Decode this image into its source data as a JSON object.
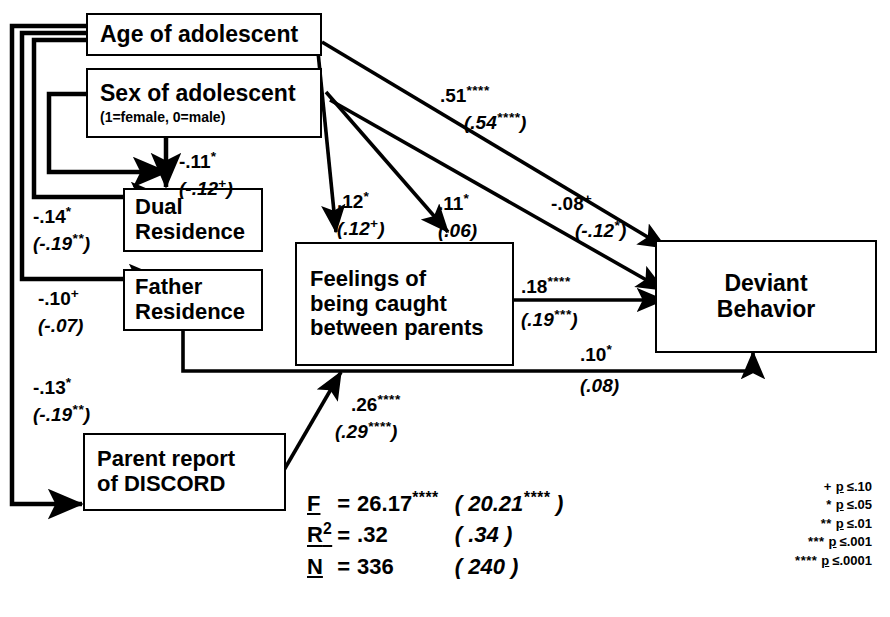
{
  "diagram": {
    "type": "path-diagram",
    "nodes": [
      {
        "id": "age",
        "label": "Age of adolescent",
        "sublabel": ""
      },
      {
        "id": "sex",
        "label": "Sex of adolescent",
        "sublabel": "(1=female, 0=male)"
      },
      {
        "id": "dual",
        "label": "Dual\nResidence",
        "sublabel": ""
      },
      {
        "id": "father",
        "label": "Father\nResidence",
        "sublabel": ""
      },
      {
        "id": "caught",
        "label": "Feelings of\nbeing caught\nbetween parents",
        "sublabel": ""
      },
      {
        "id": "deviant",
        "label": "Deviant\nBehavior",
        "sublabel": ""
      },
      {
        "id": "discord",
        "label": "Parent report\nof DISCORD",
        "sublabel": ""
      }
    ],
    "paths": [
      {
        "id": "sex-dual",
        "from": "sex",
        "to": "dual",
        "coef": "-.11",
        "stars": "*",
        "coef2": "(-.12",
        "stars2": "+",
        "coef2_close": ")"
      },
      {
        "id": "age-dual",
        "from": "age",
        "to": "dual",
        "coef": "-.14",
        "stars": "*",
        "coef2": "(-.19",
        "stars2": "**",
        "coef2_close": ")"
      },
      {
        "id": "age-father",
        "from": "age",
        "to": "father",
        "coef": "-.10",
        "stars": "+",
        "coef2": "(-.07",
        "stars2": "",
        "coef2_close": ")"
      },
      {
        "id": "age-discord",
        "from": "age",
        "to": "discord",
        "coef": "-.13",
        "stars": "*",
        "coef2": "(-.19",
        "stars2": "**",
        "coef2_close": ")"
      },
      {
        "id": "age-caught",
        "from": "age",
        "to": "caught",
        "coef": ".12",
        "stars": "*",
        "coef2": "(.12",
        "stars2": "+",
        "coef2_close": ")"
      },
      {
        "id": "sex-caught",
        "from": "sex",
        "to": "caught",
        "coef": ".11",
        "stars": "*",
        "coef2": "(.06",
        "stars2": "",
        "coef2_close": ")"
      },
      {
        "id": "sex-deviant",
        "from": "sex",
        "to": "deviant",
        "coef": "-.08",
        "stars": "+",
        "coef2": "(-.12",
        "stars2": "*",
        "coef2_close": ")"
      },
      {
        "id": "age-deviant",
        "from": "age",
        "to": "deviant",
        "coef": ".51",
        "stars": "****",
        "coef2": "(.54",
        "stars2": "****",
        "coef2_close": ")"
      },
      {
        "id": "caught-deviant",
        "from": "caught",
        "to": "deviant",
        "coef": ".18",
        "stars": "****",
        "coef2": "(.19",
        "stars2": "***",
        "coef2_close": ")"
      },
      {
        "id": "father-deviant",
        "from": "father",
        "to": "deviant",
        "coef": ".10",
        "stars": "*",
        "coef2": "(.08",
        "stars2": "",
        "coef2_close": ")"
      },
      {
        "id": "discord-caught",
        "from": "discord",
        "to": "caught",
        "coef": ".26",
        "stars": "****",
        "coef2": "(.29",
        "stars2": "****",
        "coef2_close": ")"
      }
    ]
  },
  "stats": {
    "rows": [
      {
        "key": "F",
        "sup": "",
        "eq": "=",
        "value": "26.17",
        "stars": "****",
        "paren": "( 20.21",
        "paren_stars": "****",
        "paren_close": " )"
      },
      {
        "key": "R",
        "sup": "2",
        "eq": "=",
        "value": ".32",
        "stars": "",
        "paren": "( .34",
        "paren_stars": "",
        "paren_close": " )"
      },
      {
        "key": "N",
        "sup": "",
        "eq": "=",
        "value": "336",
        "stars": "",
        "paren": "( 240",
        "paren_stars": "",
        "paren_close": " )"
      }
    ]
  },
  "legend": {
    "rows": [
      {
        "stars": "+",
        "p": "p",
        "op": "≤",
        "value": ".10"
      },
      {
        "stars": "*",
        "p": "p",
        "op": "≤",
        "value": ".05"
      },
      {
        "stars": "**",
        "p": "p",
        "op": "≤",
        "value": ".01"
      },
      {
        "stars": "***",
        "p": "p",
        "op": "≤",
        "value": ".001"
      },
      {
        "stars": "****",
        "p": "p",
        "op": "≤",
        "value": ".0001"
      }
    ]
  },
  "colors": {
    "ink": "#000000",
    "paper": "#ffffff"
  }
}
